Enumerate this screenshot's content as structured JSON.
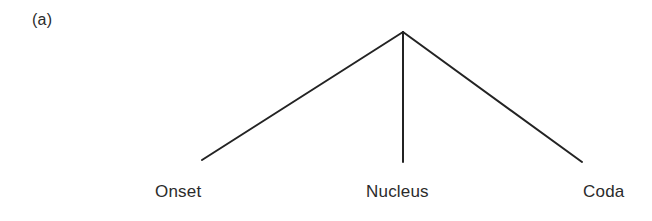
{
  "figure": {
    "label": "(a)",
    "caption_present": false
  },
  "colors": {
    "background": "#ffffff",
    "stroke": "#232323",
    "text": "#2b2b2b"
  },
  "chart_data": {
    "type": "diagram",
    "diagram_kind": "syllable-structure-tree",
    "title": "(a)",
    "root": {
      "label": "",
      "x": 403,
      "y": 32
    },
    "nodes": [
      {
        "id": "onset",
        "label": "Onset",
        "x": 202,
        "y": 160
      },
      {
        "id": "nucleus",
        "label": "Nucleus",
        "x": 403,
        "y": 162
      },
      {
        "id": "coda",
        "label": "Coda",
        "x": 582,
        "y": 162
      }
    ],
    "edges": [
      {
        "from": "root",
        "to": "onset",
        "x1": 403,
        "y1": 32,
        "x2": 202,
        "y2": 160
      },
      {
        "from": "root",
        "to": "nucleus",
        "x1": 403,
        "y1": 32,
        "x2": 403,
        "y2": 162
      },
      {
        "from": "root",
        "to": "coda",
        "x1": 403,
        "y1": 32,
        "x2": 582,
        "y2": 162
      }
    ],
    "stroke_width": 2,
    "grid": false,
    "legend": false
  },
  "labels": {
    "onset": "Onset",
    "nucleus": "Nucleus",
    "coda": "Coda"
  }
}
